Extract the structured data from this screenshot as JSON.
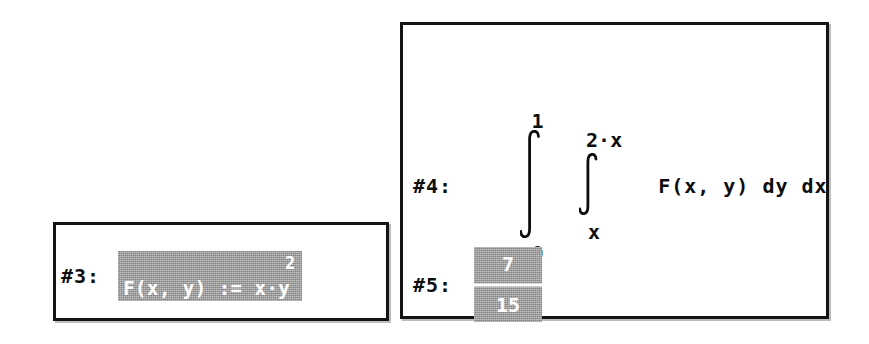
{
  "app": {
    "background_color": "#ffffff",
    "border_color": "#141414",
    "highlight_color": "#9e9e9e",
    "highlight_text_color": "#ffffff",
    "text_color": "#0d0d0d"
  },
  "definition_window": {
    "name": "definition-window",
    "expression": {
      "label": "#3:",
      "selected": true,
      "body": "F(x, y) := x·y",
      "exponent": "2",
      "full_text": "F(x, y) := x·y^2"
    }
  },
  "integral_window": {
    "name": "integral-window",
    "expressions": [
      {
        "label": "#4:",
        "selected": false,
        "type": "double-integral",
        "outer_integral": {
          "sign": "∫",
          "upper_limit": "1",
          "lower_limit": "0",
          "variable": "dx"
        },
        "inner_integral": {
          "sign": "∫",
          "upper_limit": "2·x",
          "lower_limit": "x",
          "variable": "dy"
        },
        "integrand": "F(x, y) dy dx",
        "full_text": "∫(0 to 1) ∫(x to 2·x) F(x, y) dy dx"
      },
      {
        "label": "#5:",
        "selected": true,
        "type": "fraction",
        "numerator": "7",
        "denominator": "15",
        "full_text": "7/15"
      }
    ]
  }
}
